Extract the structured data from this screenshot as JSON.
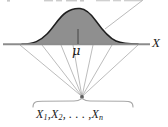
{
  "figure": {
    "kind": "statistics-diagram",
    "background_color": "#ffffff",
    "axis": {
      "label": "X",
      "line_color": "#8c8c8c",
      "x_start": 3,
      "x_end": 150,
      "y": 44
    },
    "mean_marker": {
      "label": "μ",
      "tick_color": "#4d4d4d",
      "x": 78
    },
    "curve": {
      "fill_color": "#8f8f8f",
      "stroke_color": "#1f1f1f",
      "left_foot_x": 22,
      "right_foot_x": 138,
      "peak_x": 78,
      "peak_y": 10
    },
    "fan": {
      "line_color": "#a3a3a3",
      "apex_x": 82,
      "apex_y": 97,
      "origin_x_values": [
        20,
        42,
        61,
        73,
        93,
        112,
        138
      ]
    },
    "brace": {
      "color": "#a8a8a8",
      "left_x": 33,
      "right_x": 133,
      "peak_x": 82,
      "y": 101
    },
    "leader_line": {
      "color": "#b0b0b0",
      "from_x": 143,
      "from_y": 0,
      "to_x": 106,
      "to_y": 28
    },
    "sample_label": {
      "terms": [
        "X",
        "X",
        "X"
      ],
      "subscripts": [
        "1",
        "2",
        "n"
      ],
      "ellipsis": ". . . ,",
      "full_text": "X1, X2, . . . , Xn"
    },
    "top_caption": ""
  }
}
